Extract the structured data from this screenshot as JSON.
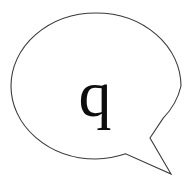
{
  "image": {
    "kind": "speech-balloon-illustration",
    "background_color": "#ffffff"
  },
  "balloon": {
    "shape": "ellipse-with-pointed-tail",
    "fill_color": "#ffffff",
    "outline_color": "#3a3a3a",
    "outline_width": 1,
    "tail_direction": "lower-right",
    "letter": "q",
    "letter_color": "#0d0d0d",
    "letter_style": "serif-lowercase"
  },
  "geometry": {
    "ellipse_center_x": 96,
    "ellipse_center_y": 86,
    "ellipse_radius_x": 85,
    "ellipse_radius_y": 73,
    "tail_base_upper_x": 163,
    "tail_base_upper_y": 118,
    "tail_notch_x": 150,
    "tail_notch_y": 138,
    "tail_base_lower_x": 125,
    "tail_base_lower_y": 154,
    "tail_tip_x": 171,
    "tail_tip_y": 174
  }
}
